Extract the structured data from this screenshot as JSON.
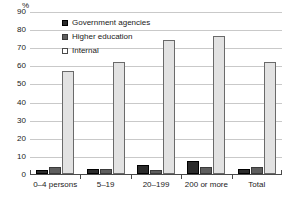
{
  "chart_data": {
    "type": "bar",
    "title": "",
    "subtitle": "",
    "xlabel": "",
    "ylabel": "%",
    "unit_label": "%",
    "categories": [
      "0–4 persons",
      "5–19",
      "20–199",
      "200 or more",
      "Total"
    ],
    "series": [
      {
        "name": "Government agencies",
        "color": "#2b2b2b",
        "values": [
          2,
          3,
          5,
          7,
          3
        ]
      },
      {
        "name": "Higher education",
        "color": "#5e5e5e",
        "values": [
          4,
          3,
          2,
          4,
          4
        ]
      },
      {
        "name": "Internal",
        "color": "#e2e2e2",
        "values": [
          57,
          62,
          74,
          76,
          62
        ]
      }
    ],
    "ylim": [
      0,
      90
    ],
    "yticks": [
      0,
      10,
      20,
      30,
      40,
      50,
      60,
      70,
      80,
      90
    ],
    "ytick_labels": [
      "0",
      "10",
      "20",
      "30",
      "40",
      "50",
      "60",
      "70",
      "80",
      "90"
    ],
    "grid": true,
    "legend_position": "top-center"
  },
  "legend": {
    "items": [
      {
        "label": "Government agencies",
        "swatch": "filled-dark-square"
      },
      {
        "label": "Higher education",
        "swatch": "filled-gray-square"
      },
      {
        "label": "Internal",
        "swatch": "open-square"
      }
    ]
  }
}
